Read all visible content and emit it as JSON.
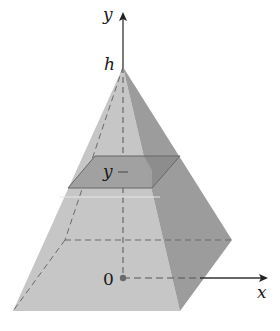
{
  "figure": {
    "labels": {
      "y_axis": "y",
      "x_axis": "x",
      "apex": "h",
      "cross_section": "y",
      "origin": "0"
    },
    "colors": {
      "front_face": "#c4c4c4",
      "side_face": "#9a9a9a",
      "cross_section_front": "#a2a2a2",
      "cross_section_side": "#878787",
      "axis": "#333333",
      "dashed": "#555555"
    }
  }
}
